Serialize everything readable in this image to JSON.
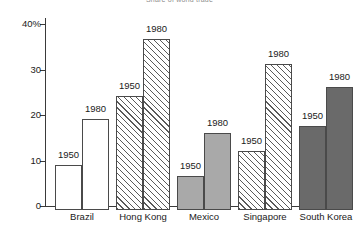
{
  "chart_data": {
    "type": "bar",
    "title": "Share of world trade",
    "xlabel": "",
    "ylabel": "",
    "ylim": [
      0,
      40
    ],
    "yticks": [
      0,
      10,
      20,
      30,
      40
    ],
    "ytick_labels": [
      "0",
      "10",
      "20",
      "30",
      "40%"
    ],
    "grid": false,
    "legend": "none",
    "categories": [
      "Brazil",
      "Hong Kong",
      "Mexico",
      "Singapore",
      "South Korea"
    ],
    "series": [
      {
        "name": "1950",
        "values": [
          10.0,
          25.0,
          7.5,
          13.0,
          18.5
        ]
      },
      {
        "name": "1980",
        "values": [
          20.0,
          37.5,
          17.0,
          32.0,
          27.0
        ]
      }
    ],
    "bar_labels": [
      [
        "1950",
        "1980"
      ],
      [
        "1950",
        "1980"
      ],
      [
        "1950",
        "1980"
      ],
      [
        "1950",
        "1980"
      ],
      [
        "1950",
        "1980"
      ]
    ],
    "group_styles": [
      "white",
      "hatch",
      "gray",
      "hatch",
      "dark"
    ],
    "colors": {
      "white": "#ffffff",
      "gray": "#a9a9a9",
      "dark": "#6a6a6a",
      "hatch_line": "#5a5a5a",
      "axis": "#3a3a3a",
      "bar_outline": "#4a4a4a",
      "text": "#1a1a1a",
      "title": "#8d8d8d"
    }
  }
}
